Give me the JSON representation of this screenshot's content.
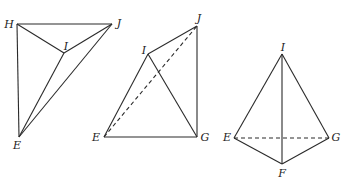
{
  "figures": [
    {
      "name": "figure-1",
      "vertices": {
        "H": {
          "label": "H",
          "x": 17,
          "y": 24,
          "lx": 9,
          "ly": 24
        },
        "J": {
          "label": "J",
          "x": 112,
          "y": 24,
          "lx": 119,
          "ly": 23
        },
        "I": {
          "label": "I",
          "x": 64,
          "y": 53,
          "lx": 66,
          "ly": 46
        },
        "E": {
          "label": "E",
          "x": 19,
          "y": 137,
          "lx": 17,
          "ly": 145
        }
      },
      "edges": [
        {
          "from": "H",
          "to": "J",
          "style": "solid"
        },
        {
          "from": "H",
          "to": "E",
          "style": "solid"
        },
        {
          "from": "H",
          "to": "I",
          "style": "solid"
        },
        {
          "from": "I",
          "to": "J",
          "style": "solid"
        },
        {
          "from": "I",
          "to": "E",
          "style": "solid"
        },
        {
          "from": "J",
          "to": "E",
          "style": "solid"
        }
      ]
    },
    {
      "name": "figure-2",
      "vertices": {
        "I": {
          "label": "I",
          "x": 148,
          "y": 54,
          "lx": 144,
          "ly": 50
        },
        "J": {
          "label": "J",
          "x": 197,
          "y": 26,
          "lx": 199,
          "ly": 18
        },
        "E": {
          "label": "E",
          "x": 104,
          "y": 137,
          "lx": 96,
          "ly": 137
        },
        "G": {
          "label": "G",
          "x": 197,
          "y": 137,
          "lx": 205,
          "ly": 137
        }
      },
      "edges": [
        {
          "from": "I",
          "to": "J",
          "style": "solid"
        },
        {
          "from": "J",
          "to": "G",
          "style": "solid"
        },
        {
          "from": "E",
          "to": "G",
          "style": "solid"
        },
        {
          "from": "E",
          "to": "I",
          "style": "solid"
        },
        {
          "from": "I",
          "to": "G",
          "style": "solid"
        },
        {
          "from": "E",
          "to": "J",
          "style": "dashed"
        }
      ]
    },
    {
      "name": "figure-3",
      "vertices": {
        "I": {
          "label": "I",
          "x": 282,
          "y": 54,
          "lx": 283,
          "ly": 47
        },
        "E": {
          "label": "E",
          "x": 234,
          "y": 138,
          "lx": 227,
          "ly": 137
        },
        "G": {
          "label": "G",
          "x": 329,
          "y": 138,
          "lx": 336,
          "ly": 137
        },
        "F": {
          "label": "F",
          "x": 282,
          "y": 164,
          "lx": 282,
          "ly": 173
        }
      },
      "edges": [
        {
          "from": "I",
          "to": "E",
          "style": "solid"
        },
        {
          "from": "I",
          "to": "G",
          "style": "solid"
        },
        {
          "from": "I",
          "to": "F",
          "style": "solid"
        },
        {
          "from": "E",
          "to": "F",
          "style": "solid"
        },
        {
          "from": "F",
          "to": "G",
          "style": "solid"
        },
        {
          "from": "E",
          "to": "G",
          "style": "dashed"
        }
      ]
    }
  ]
}
